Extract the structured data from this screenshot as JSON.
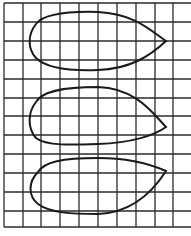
{
  "diagram": {
    "type": "grid-with-shapes",
    "background": "#ffffff",
    "grid": {
      "color": "#2a2a2a",
      "columns": 10,
      "rows": 12,
      "vertical_lines_x": [
        4,
        23,
        41,
        60,
        79,
        98,
        117,
        136,
        155,
        173
      ],
      "horizontal_lines_y": [
        3,
        22,
        41,
        60,
        79,
        98,
        116,
        135,
        154,
        173,
        192,
        211,
        227
      ],
      "x_start": 4,
      "x_end": 191,
      "y_start": 3,
      "y_end": 227
    },
    "shapes": [
      {
        "name": "teardrop-1",
        "description": "Teardrop shape with pointed tip on the right at mid-height",
        "stroke": "#1a1a1a",
        "path": "M166,41 C150,30 135,14 98,12 C60,11 42,16 36,24 C28,34 27,48 36,58 C46,68 70,71 98,70 C130,69 150,56 166,41 Z"
      },
      {
        "name": "teardrop-2",
        "description": "Teardrop shape with pointed tip on the right slightly below mid-height",
        "stroke": "#1a1a1a",
        "path": "M166,127 C152,112 135,88 98,87 C60,87 42,92 36,102 C28,112 27,128 36,138 C46,146 72,145 98,144 C132,143 155,135 166,127 Z"
      },
      {
        "name": "teardrop-3",
        "description": "Teardrop shape with pointed tip on the upper right",
        "stroke": "#1a1a1a",
        "path": "M166,171 C150,164 130,158 98,158 C62,158 44,162 38,172 C28,182 28,196 38,204 C50,213 72,214 98,214 C128,213 150,196 166,171 Z"
      }
    ]
  }
}
